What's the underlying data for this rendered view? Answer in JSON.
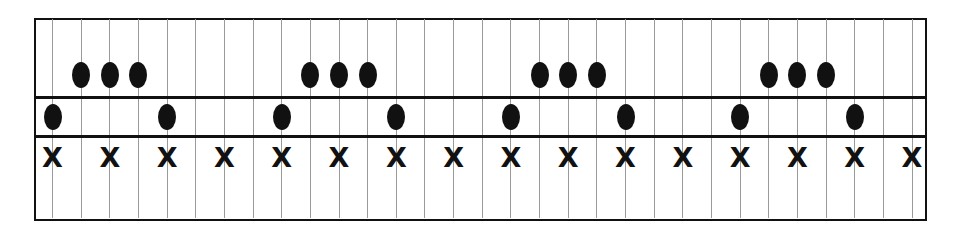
{
  "diagram": {
    "type": "rhythm-grid",
    "grid": {
      "columns": 31,
      "first_line_x": 52.5,
      "spacing": 28.65,
      "rows": [
        "top-dots",
        "middle-dots",
        "x-marks"
      ]
    },
    "rows": {
      "top": {
        "symbol": "dot",
        "y": 75,
        "positions": [
          1,
          2,
          3,
          9,
          10,
          11,
          17,
          18,
          19,
          25,
          26,
          27
        ]
      },
      "middle": {
        "symbol": "dot",
        "y": 117,
        "positions": [
          0,
          4,
          8,
          12,
          16,
          20,
          24,
          28
        ]
      },
      "bottom": {
        "symbol": "X",
        "label": "X",
        "y": 158,
        "positions": [
          0,
          2,
          4,
          6,
          8,
          10,
          12,
          14,
          16,
          18,
          20,
          22,
          24,
          26,
          28,
          30
        ]
      }
    },
    "separators_y": [
      96,
      135
    ],
    "colors": {
      "ink": "#111111",
      "gridline": "#9a9a9a",
      "background": "#ffffff"
    }
  }
}
